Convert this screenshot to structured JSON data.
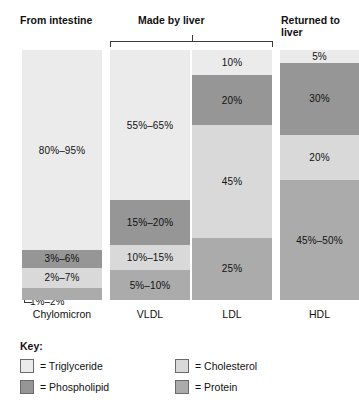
{
  "headers": {
    "intestine": "From intestine",
    "liver": "Made by liver",
    "returned": "Returned to liver"
  },
  "key": {
    "title": "Key:",
    "items": [
      {
        "label": "= Triglyceride",
        "component": "Triglyceride",
        "color": "#ebebeb"
      },
      {
        "label": "= Cholesterol",
        "component": "Cholesterol",
        "color": "#d9d9d9"
      },
      {
        "label": "= Phospholipid",
        "component": "Phospholipid",
        "color": "#969696"
      },
      {
        "label": "= Protein",
        "component": "Protein",
        "color": "#ababab"
      }
    ]
  },
  "callouts": {
    "chylomicron_protein": "1%–2%"
  },
  "categories": [
    {
      "name": "Chylomicron"
    },
    {
      "name": "VLDL"
    },
    {
      "name": "LDL"
    },
    {
      "name": "HDL"
    }
  ],
  "bars": [
    {
      "name": "Chylomicron",
      "segments": [
        {
          "component": "Triglyceride",
          "label": "80%–95%",
          "height_pct": 80,
          "color": "#ebebeb",
          "show_label": true
        },
        {
          "component": "Phospholipid",
          "label": "3%–6%",
          "height_pct": 7,
          "color": "#969696",
          "show_label": true
        },
        {
          "component": "Cholesterol",
          "label": "2%–7%",
          "height_pct": 8,
          "color": "#d9d9d9",
          "show_label": true
        },
        {
          "component": "Protein",
          "label": "1%–2%",
          "height_pct": 5,
          "color": "#ababab",
          "show_label": false
        }
      ]
    },
    {
      "name": "VLDL",
      "segments": [
        {
          "component": "Triglyceride",
          "label": "55%–65%",
          "height_pct": 60,
          "color": "#ebebeb",
          "show_label": true
        },
        {
          "component": "Phospholipid",
          "label": "15%–20%",
          "height_pct": 18,
          "color": "#969696",
          "show_label": true
        },
        {
          "component": "Cholesterol",
          "label": "10%–15%",
          "height_pct": 10,
          "color": "#d9d9d9",
          "show_label": true
        },
        {
          "component": "Protein",
          "label": "5%–10%",
          "height_pct": 12,
          "color": "#ababab",
          "show_label": true
        }
      ]
    },
    {
      "name": "LDL",
      "segments": [
        {
          "component": "Triglyceride",
          "label": "10%",
          "height_pct": 10,
          "color": "#ebebeb",
          "show_label": true
        },
        {
          "component": "Phospholipid",
          "label": "20%",
          "height_pct": 20,
          "color": "#969696",
          "show_label": true
        },
        {
          "component": "Cholesterol",
          "label": "45%",
          "height_pct": 45,
          "color": "#d9d9d9",
          "show_label": true
        },
        {
          "component": "Protein",
          "label": "25%",
          "height_pct": 25,
          "color": "#ababab",
          "show_label": true
        }
      ]
    },
    {
      "name": "HDL",
      "segments": [
        {
          "component": "Triglyceride",
          "label": "5%",
          "height_pct": 5,
          "color": "#ebebeb",
          "show_label": true
        },
        {
          "component": "Phospholipid",
          "label": "30%",
          "height_pct": 29,
          "color": "#969696",
          "show_label": true
        },
        {
          "component": "Cholesterol",
          "label": "20%",
          "height_pct": 18,
          "color": "#d9d9d9",
          "show_label": true
        },
        {
          "component": "Protein",
          "label": "45%–50%",
          "height_pct": 48,
          "color": "#ababab",
          "show_label": true
        }
      ]
    }
  ],
  "chart_data": {
    "type": "bar",
    "title": "",
    "subtype": "stacked-100-percent",
    "xlabel": "",
    "ylabel": "Composition (%)",
    "ylim": [
      0,
      100
    ],
    "grid": false,
    "legend_position": "bottom-left",
    "categories": [
      "Chylomicron",
      "VLDL",
      "LDL",
      "HDL"
    ],
    "group_annotations": [
      {
        "label": "From intestine",
        "categories": [
          "Chylomicron"
        ]
      },
      {
        "label": "Made by liver",
        "categories": [
          "VLDL",
          "LDL"
        ]
      },
      {
        "label": "Returned to liver",
        "categories": [
          "HDL"
        ]
      }
    ],
    "series": [
      {
        "name": "Triglyceride",
        "color": "#ebebeb",
        "values": [
          "80%–95%",
          "55%–65%",
          "10%",
          "5%"
        ],
        "numeric_midpoints": [
          87.5,
          60,
          10,
          5
        ]
      },
      {
        "name": "Phospholipid",
        "color": "#969696",
        "values": [
          "3%–6%",
          "15%–20%",
          "20%",
          "30%"
        ],
        "numeric_midpoints": [
          4.5,
          17.5,
          20,
          30
        ]
      },
      {
        "name": "Cholesterol",
        "color": "#d9d9d9",
        "values": [
          "2%–7%",
          "10%–15%",
          "45%",
          "20%"
        ],
        "numeric_midpoints": [
          4.5,
          12.5,
          45,
          20
        ]
      },
      {
        "name": "Protein",
        "color": "#ababab",
        "values": [
          "1%–2%",
          "5%–10%",
          "25%",
          "45%–50%"
        ],
        "numeric_midpoints": [
          1.5,
          7.5,
          25,
          47.5
        ]
      }
    ],
    "stack_order_top_to_bottom": [
      "Triglyceride",
      "Phospholipid",
      "Cholesterol",
      "Protein"
    ]
  }
}
